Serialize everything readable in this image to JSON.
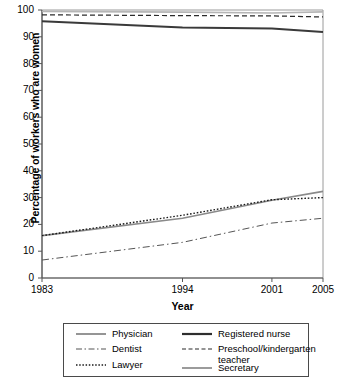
{
  "chart_data": {
    "type": "line",
    "title": "",
    "xlabel": "Year",
    "ylabel": "Percentage of workers who are women",
    "x": [
      1983,
      1994,
      2001,
      2005
    ],
    "xticks": [
      "1983",
      "1994",
      "2001",
      "2005"
    ],
    "yticks": [
      "0",
      "10",
      "20",
      "30",
      "40",
      "50",
      "60",
      "70",
      "80",
      "90",
      "100"
    ],
    "xlim": [
      1983,
      2005
    ],
    "ylim": [
      0,
      100
    ],
    "grid": false,
    "legend_position": "below-plot",
    "series": [
      {
        "name": "Physician",
        "style": "solid",
        "color": "#8a8a8a",
        "width": 1.7,
        "values": [
          15.8,
          22.3,
          29.0,
          32.3
        ]
      },
      {
        "name": "Dentist",
        "style": "dashdot",
        "color": "#555555",
        "width": 1.0,
        "values": [
          6.7,
          13.3,
          20.5,
          22.3
        ]
      },
      {
        "name": "Lawyer",
        "style": "dotted",
        "color": "#1a1a1a",
        "width": 1.4,
        "values": [
          15.8,
          23.4,
          29.2,
          30.0
        ]
      },
      {
        "name": "Registered nurse",
        "style": "solid",
        "color": "#3a3a3a",
        "width": 2.0,
        "values": [
          95.8,
          93.5,
          93.1,
          91.8
        ]
      },
      {
        "name": "Preschool/kindergarten\nteacher",
        "style": "dashed",
        "color": "#2a2a2a",
        "width": 1.2,
        "values": [
          98.2,
          97.9,
          97.8,
          97.4
        ]
      },
      {
        "name": "Secretary",
        "style": "solid",
        "color": "#b5b5b5",
        "width": 1.6,
        "values": [
          99.5,
          99.2,
          98.9,
          99.3
        ]
      }
    ]
  },
  "axis": {
    "y_label": "Percentage of workers who are women",
    "x_label": "Year",
    "y_ticks": [
      "100",
      "90",
      "80",
      "70",
      "60",
      "50",
      "40",
      "30",
      "20",
      "10",
      "0"
    ],
    "x_ticks": [
      "1983",
      "1994",
      "2001",
      "2005"
    ]
  },
  "legend": {
    "entries": [
      {
        "label": "Physician",
        "style": "solid-gray"
      },
      {
        "label": "Registered nurse",
        "style": "solid-thick-dark"
      },
      {
        "label": "Dentist",
        "style": "dashdot"
      },
      {
        "label": "Preschool/kindergarten\nteacher",
        "style": "dashed"
      },
      {
        "label": "Lawyer",
        "style": "dotted"
      },
      {
        "label": "Secretary",
        "style": "solid-thin"
      }
    ]
  }
}
